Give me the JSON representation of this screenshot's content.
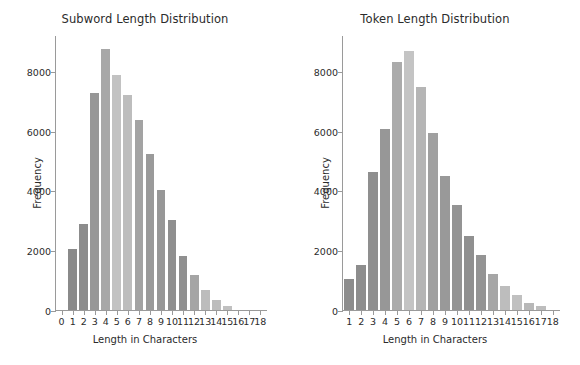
{
  "figure": {
    "width": 580,
    "height": 365,
    "background": "#ffffff"
  },
  "chart_data": [
    {
      "type": "bar",
      "title": "Subword Length Distribution",
      "xlabel": "Length in Characters",
      "ylabel": "Frequency",
      "categories": [
        1,
        2,
        3,
        4,
        5,
        6,
        7,
        8,
        9,
        10,
        11,
        12,
        13,
        14,
        15
      ],
      "values": [
        2030,
        2880,
        7250,
        8720,
        7870,
        7180,
        6350,
        5220,
        4010,
        3000,
        1820,
        1180,
        680,
        330,
        150
      ],
      "xticks": [
        0,
        1,
        2,
        3,
        4,
        5,
        6,
        7,
        8,
        9,
        10,
        11,
        12,
        13,
        14,
        15,
        16,
        17,
        18
      ],
      "yticks": [
        0,
        2000,
        4000,
        6000,
        8000
      ],
      "ytick_labels": [
        "0",
        "2000",
        "4000",
        "6000",
        "8000"
      ],
      "xlim": [
        -0.6,
        18.6
      ],
      "ylim": [
        0,
        9200
      ],
      "grid": false,
      "legend": false,
      "bar_colors": [
        "#8a8a8a",
        "#8c8c8c",
        "#979797",
        "#a8a8a8",
        "#c2c2c2",
        "#bdbdbd",
        "#a3a3a3",
        "#9a9a9a",
        "#979797",
        "#8f8f8f",
        "#909090",
        "#a5a5a5",
        "#bcbcbc",
        "#bdbdbd",
        "#c0c0c0"
      ]
    },
    {
      "type": "bar",
      "title": "Token Length Distribution",
      "xlabel": "Length in Characters",
      "ylabel": "Frequency",
      "categories": [
        1,
        2,
        3,
        4,
        5,
        6,
        7,
        8,
        9,
        10,
        11,
        12,
        13,
        14,
        15,
        16,
        17
      ],
      "values": [
        1030,
        1500,
        4610,
        6070,
        8290,
        8650,
        7460,
        5920,
        4490,
        3520,
        2490,
        1840,
        1220,
        790,
        500,
        250,
        140
      ],
      "xticks": [
        1,
        2,
        3,
        4,
        5,
        6,
        7,
        8,
        9,
        10,
        11,
        12,
        13,
        14,
        15,
        16,
        17,
        18
      ],
      "yticks": [
        0,
        2000,
        4000,
        6000,
        8000
      ],
      "ytick_labels": [
        "0",
        "2000",
        "4000",
        "6000",
        "8000"
      ],
      "xlim": [
        0.4,
        18.6
      ],
      "ylim": [
        0,
        9200
      ],
      "grid": false,
      "legend": false,
      "bar_colors": [
        "#8c8c8c",
        "#8d8d8d",
        "#8f8f8f",
        "#979797",
        "#ababab",
        "#c4c4c4",
        "#b5b5b5",
        "#a0a0a0",
        "#999999",
        "#949494",
        "#909090",
        "#949494",
        "#a6a6a6",
        "#bdbdbd",
        "#c0c0c0",
        "#b8b8b8",
        "#bdbdbd"
      ]
    }
  ]
}
